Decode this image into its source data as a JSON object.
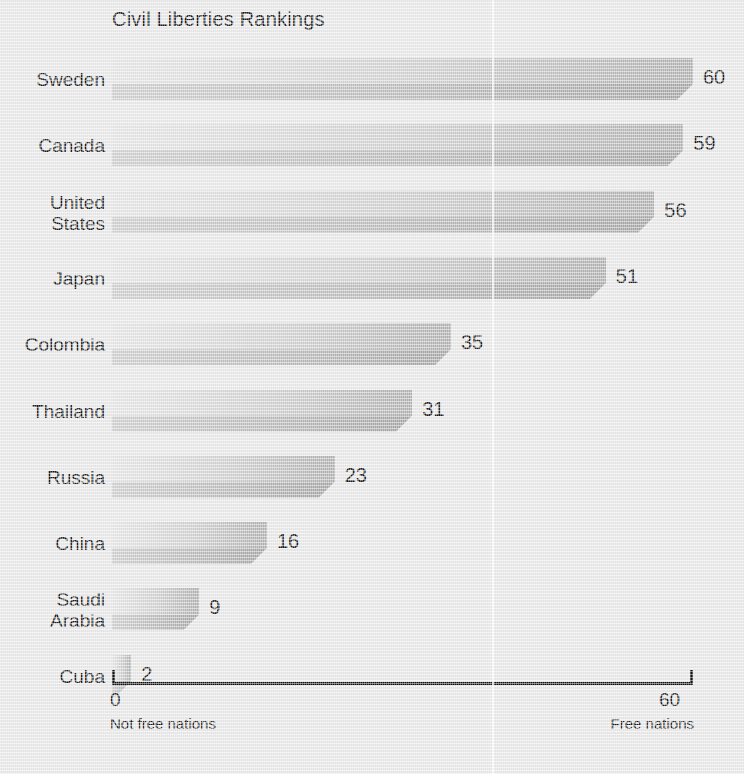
{
  "chart_data": {
    "type": "bar",
    "orientation": "horizontal",
    "title": "Civil Liberties Rankings",
    "categories": [
      "Sweden",
      "Canada",
      "United\nStates",
      "Japan",
      "Colombia",
      "Thailand",
      "Russia",
      "China",
      "Saudi\nArabia",
      "Cuba"
    ],
    "values": [
      60,
      59,
      56,
      51,
      35,
      31,
      23,
      16,
      9,
      2
    ],
    "xlabel": "",
    "ylabel": "",
    "xlim": [
      0,
      60
    ],
    "axis_ticks": [
      "0",
      "60"
    ],
    "axis_min_caption": "Not free nations",
    "axis_max_caption": "Free nations",
    "grid": false,
    "legend": false,
    "data_labels": [
      "60",
      "59",
      "56",
      "51",
      "35",
      "31",
      "23",
      "16",
      "9",
      "2"
    ]
  },
  "style": {
    "background": "#e9e9e9",
    "bar_light": "#dedede",
    "bar_dark": "#b4b4b4",
    "text": "#1a1a1a",
    "axis": "#131313"
  }
}
